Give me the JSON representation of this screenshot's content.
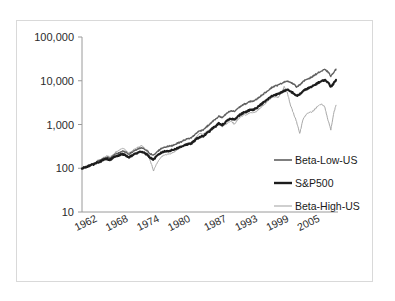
{
  "figure": {
    "background_color": "#ffffff",
    "frame_border_color": "#d9d9d9",
    "scan_artifact_text": "-- -"
  },
  "chart_data": {
    "type": "line",
    "title": "",
    "subtitle": "",
    "xlabel": "",
    "ylabel": "",
    "yscale": "log",
    "ylim": [
      10,
      100000
    ],
    "ytick_labels": [
      "100,000",
      "10,000",
      "1,000",
      "100",
      "10"
    ],
    "ytick_values": [
      100000,
      10000,
      1000,
      100,
      10
    ],
    "xtick_labels": [
      "1962",
      "1968",
      "1974",
      "1980",
      "1987",
      "1993",
      "1999",
      "2005"
    ],
    "xtick_values": [
      1962,
      1968,
      1974,
      1980,
      1987,
      1993,
      1999,
      2005
    ],
    "xlim": [
      1961,
      2010
    ],
    "grid": false,
    "legend_position": "right-inside",
    "legend_entries": [
      "Beta-Low-US",
      "S&P500",
      "Beta-High-US"
    ],
    "series": [
      {
        "name": "Beta-Low-US",
        "color": "#5f5f5f",
        "width": 1.3,
        "x": [
          1961.0,
          1961.6,
          1962.2,
          1962.8,
          1963.4,
          1964.0,
          1964.6,
          1965.2,
          1965.8,
          1966.4,
          1967.0,
          1967.6,
          1968.2,
          1968.8,
          1969.4,
          1970.0,
          1970.6,
          1971.2,
          1971.8,
          1972.4,
          1973.0,
          1973.6,
          1974.2,
          1974.8,
          1975.4,
          1976.0,
          1976.6,
          1977.2,
          1977.8,
          1978.4,
          1979.0,
          1979.6,
          1980.2,
          1980.8,
          1981.4,
          1982.0,
          1982.6,
          1983.2,
          1983.8,
          1984.4,
          1985.0,
          1985.6,
          1986.2,
          1986.8,
          1987.4,
          1988.0,
          1988.6,
          1989.2,
          1989.8,
          1990.4,
          1991.0,
          1991.6,
          1992.2,
          1992.8,
          1993.4,
          1994.0,
          1994.6,
          1995.2,
          1995.8,
          1996.4,
          1997.0,
          1997.6,
          1998.2,
          1998.8,
          1999.4,
          2000.0,
          2000.6,
          2001.2,
          2001.8,
          2002.4,
          2003.0,
          2003.6,
          2004.2,
          2004.8,
          2005.4,
          2006.0,
          2006.6,
          2007.2,
          2007.8,
          2008.4,
          2009.0,
          2009.6,
          2010.0
        ],
        "y": [
          100,
          106,
          114,
          122,
          131,
          143,
          152,
          166,
          178,
          172,
          190,
          212,
          228,
          246,
          232,
          212,
          228,
          258,
          272,
          292,
          276,
          248,
          214,
          196,
          232,
          268,
          296,
          310,
          318,
          330,
          356,
          382,
          404,
          448,
          470,
          492,
          560,
          660,
          720,
          760,
          880,
          1000,
          1180,
          1320,
          1560,
          1420,
          1640,
          1900,
          2050,
          1980,
          2320,
          2600,
          2880,
          3050,
          3350,
          3420,
          3700,
          4250,
          4800,
          5400,
          6200,
          7000,
          7600,
          7900,
          8600,
          9400,
          9900,
          9200,
          8400,
          7300,
          8100,
          9400,
          10600,
          11400,
          12300,
          13800,
          15300,
          16600,
          17900,
          16200,
          12800,
          15600,
          18400
        ]
      },
      {
        "name": "S&P500",
        "color": "#1c1c1c",
        "width": 2.1,
        "x": [
          1961.0,
          1961.6,
          1962.2,
          1962.8,
          1963.4,
          1964.0,
          1964.6,
          1965.2,
          1965.8,
          1966.4,
          1967.0,
          1967.6,
          1968.2,
          1968.8,
          1969.4,
          1970.0,
          1970.6,
          1971.2,
          1971.8,
          1972.4,
          1973.0,
          1973.6,
          1974.2,
          1974.8,
          1975.4,
          1976.0,
          1976.6,
          1977.2,
          1977.8,
          1978.4,
          1979.0,
          1979.6,
          1980.2,
          1980.8,
          1981.4,
          1982.0,
          1982.6,
          1983.2,
          1983.8,
          1984.4,
          1985.0,
          1985.6,
          1986.2,
          1986.8,
          1987.4,
          1988.0,
          1988.6,
          1989.2,
          1989.8,
          1990.4,
          1991.0,
          1991.6,
          1992.2,
          1992.8,
          1993.4,
          1994.0,
          1994.6,
          1995.2,
          1995.8,
          1996.4,
          1997.0,
          1997.6,
          1998.2,
          1998.8,
          1999.4,
          2000.0,
          2000.6,
          2001.2,
          2001.8,
          2002.4,
          2003.0,
          2003.6,
          2004.2,
          2004.8,
          2005.4,
          2006.0,
          2006.6,
          2007.2,
          2007.8,
          2008.4,
          2009.0,
          2009.6,
          2010.0
        ],
        "y": [
          100,
          105,
          112,
          118,
          126,
          136,
          144,
          155,
          164,
          156,
          172,
          188,
          198,
          212,
          196,
          178,
          192,
          214,
          226,
          242,
          228,
          202,
          172,
          158,
          188,
          216,
          238,
          244,
          250,
          258,
          276,
          296,
          312,
          342,
          352,
          364,
          412,
          482,
          520,
          540,
          620,
          700,
          824,
          908,
          1070,
          960,
          1100,
          1270,
          1360,
          1300,
          1520,
          1700,
          1870,
          1970,
          2160,
          2190,
          2360,
          2700,
          3040,
          3420,
          3920,
          4420,
          4780,
          4960,
          5400,
          5880,
          6200,
          5700,
          5200,
          4480,
          4900,
          5700,
          6400,
          6850,
          7350,
          8200,
          9050,
          9750,
          10400,
          9350,
          7300,
          8900,
          10500
        ]
      },
      {
        "name": "Beta-High-US",
        "color": "#a8a8a8",
        "width": 1.0,
        "x": [
          1961.0,
          1961.6,
          1962.2,
          1962.8,
          1963.4,
          1964.0,
          1964.6,
          1965.2,
          1965.8,
          1966.4,
          1967.0,
          1967.6,
          1968.2,
          1968.8,
          1969.4,
          1970.0,
          1970.6,
          1971.2,
          1971.8,
          1972.4,
          1973.0,
          1973.6,
          1974.2,
          1974.8,
          1975.4,
          1976.0,
          1976.6,
          1977.2,
          1977.8,
          1978.4,
          1979.0,
          1979.6,
          1980.2,
          1980.8,
          1981.4,
          1982.0,
          1982.6,
          1983.2,
          1983.8,
          1984.4,
          1985.0,
          1985.6,
          1986.2,
          1986.8,
          1987.4,
          1988.0,
          1988.6,
          1989.2,
          1989.8,
          1990.4,
          1991.0,
          1991.6,
          1992.2,
          1992.8,
          1993.4,
          1994.0,
          1994.6,
          1995.2,
          1995.8,
          1996.4,
          1997.0,
          1997.6,
          1998.2,
          1998.8,
          1999.4,
          2000.0,
          2000.6,
          2001.2,
          2001.8,
          2002.4,
          2003.0,
          2003.6,
          2004.2,
          2004.8,
          2005.4,
          2006.0,
          2006.6,
          2007.2,
          2007.8,
          2008.4,
          2009.0,
          2009.6,
          2010.0
        ],
        "y": [
          100,
          107,
          116,
          124,
          134,
          148,
          158,
          175,
          192,
          180,
          205,
          238,
          262,
          290,
          262,
          220,
          242,
          282,
          300,
          328,
          300,
          232,
          146,
          88,
          128,
          168,
          196,
          204,
          212,
          224,
          248,
          276,
          300,
          352,
          368,
          378,
          440,
          560,
          620,
          600,
          680,
          740,
          860,
          900,
          1080,
          880,
          980,
          1120,
          1180,
          1020,
          1280,
          1520,
          1640,
          1700,
          1880,
          1820,
          1960,
          2320,
          2640,
          3050,
          3600,
          4100,
          4300,
          4150,
          5200,
          7200,
          5400,
          2800,
          1800,
          1150,
          620,
          1250,
          1680,
          1850,
          1950,
          2300,
          2650,
          2900,
          2600,
          1350,
          760,
          1900,
          2750
        ]
      }
    ]
  },
  "axes": {
    "y_ticks": [
      {
        "label": "100,000",
        "value": 100000
      },
      {
        "label": "10,000",
        "value": 10000
      },
      {
        "label": "1,000",
        "value": 1000
      },
      {
        "label": "100",
        "value": 100
      },
      {
        "label": "10",
        "value": 10
      }
    ],
    "x_ticks": [
      {
        "label": "1962",
        "value": 1962
      },
      {
        "label": "1968",
        "value": 1968
      },
      {
        "label": "1974",
        "value": 1974
      },
      {
        "label": "1980",
        "value": 1980
      },
      {
        "label": "1987",
        "value": 1987
      },
      {
        "label": "1993",
        "value": 1993
      },
      {
        "label": "1999",
        "value": 1999
      },
      {
        "label": "2005",
        "value": 2005
      }
    ]
  },
  "legend": {
    "items": [
      {
        "label": "Beta-Low-US",
        "color": "#5f5f5f",
        "width": 1.6
      },
      {
        "label": "S&P500",
        "color": "#1c1c1c",
        "width": 2.4
      },
      {
        "label": "Beta-High-US",
        "color": "#a8a8a8",
        "width": 1.1
      }
    ]
  }
}
